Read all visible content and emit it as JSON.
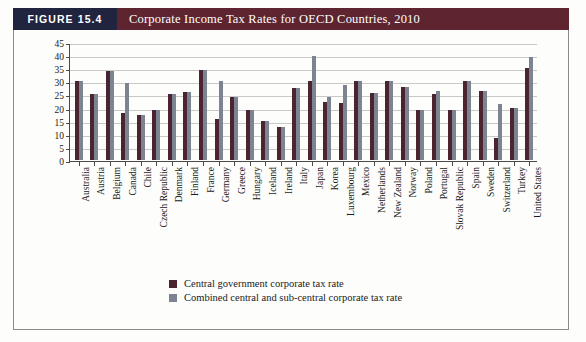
{
  "figure": {
    "tag": "FIGURE 15.4",
    "title": "Corporate Income Tax Rates for OECD Countries, 2010"
  },
  "colors": {
    "tag_bg": "#21243f",
    "title_bg": "#5e2530",
    "central": "#4a2430",
    "combined": "#7b8490",
    "grid": "#c9c9c9",
    "axis": "#4a4a4a"
  },
  "chart_data": {
    "type": "bar",
    "title": "Corporate Income Tax Rates for OECD Countries, 2010",
    "xlabel": "",
    "ylabel": "",
    "ylim": [
      0,
      45
    ],
    "yticks": [
      0,
      5,
      10,
      15,
      20,
      25,
      30,
      35,
      40,
      45
    ],
    "grid": true,
    "legend_position": "bottom",
    "categories": [
      "Australia",
      "Austria",
      "Belgium",
      "Canada",
      "Chile",
      "Czech Republic",
      "Denmark",
      "Finland",
      "France",
      "Germany",
      "Greece",
      "Hungary",
      "Iceland",
      "Ireland",
      "Italy",
      "Japan",
      "Korea",
      "Luxembourg",
      "Mexico",
      "Netherlands",
      "New Zealand",
      "Norway",
      "Poland",
      "Portugal",
      "Slovak Republic",
      "Spain",
      "Sweden",
      "Switzerland",
      "Turkey",
      "United States"
    ],
    "series": [
      {
        "name": "Central government corporate tax rate",
        "color": "#4a2430",
        "values": [
          30.0,
          25.0,
          34.0,
          18.0,
          17.0,
          19.0,
          25.0,
          26.0,
          34.4,
          15.8,
          24.0,
          19.0,
          15.0,
          12.5,
          27.5,
          30.0,
          22.0,
          21.8,
          30.0,
          25.5,
          30.0,
          28.0,
          19.0,
          25.0,
          19.0,
          30.0,
          26.3,
          8.5,
          20.0,
          35.0
        ]
      },
      {
        "name": "Combined central and sub-central corporate tax rate",
        "color": "#7b8490",
        "values": [
          30.0,
          25.0,
          34.0,
          29.5,
          17.0,
          19.0,
          25.0,
          26.0,
          34.4,
          30.2,
          24.0,
          19.0,
          15.0,
          12.5,
          27.5,
          39.5,
          24.2,
          28.6,
          30.0,
          25.5,
          30.0,
          28.0,
          19.0,
          26.5,
          19.0,
          30.0,
          26.3,
          21.2,
          20.0,
          39.2
        ]
      }
    ]
  },
  "legend": {
    "items": [
      {
        "label": "Central government corporate tax rate",
        "swatch": "central"
      },
      {
        "label": "Combined central and sub-central corporate tax rate",
        "swatch": "combined"
      }
    ]
  }
}
